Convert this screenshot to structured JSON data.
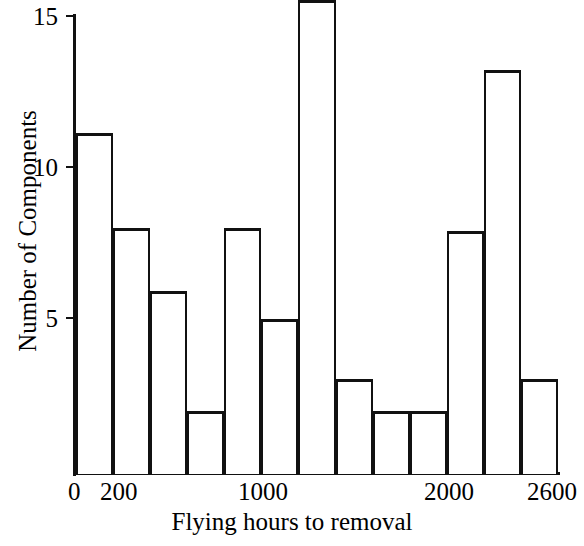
{
  "chart_data": {
    "type": "bar",
    "title": "",
    "xlabel": "Flying hours to removal",
    "ylabel": "Number of Components",
    "ylim": [
      0,
      15
    ],
    "xlim": [
      0,
      2600
    ],
    "grid": false,
    "legend": "none",
    "bin_width": 200,
    "y_ticks": [
      {
        "value": 15,
        "label": "15"
      },
      {
        "value": 10,
        "label": "10"
      },
      {
        "value": 5,
        "label": "5"
      }
    ],
    "x_ticks": [
      {
        "value": 0,
        "label": "0"
      },
      {
        "value": 200,
        "label": "200"
      },
      {
        "value": 1000,
        "label": "1000"
      },
      {
        "value": 2000,
        "label": "2000"
      },
      {
        "value": 2600,
        "label": "2600"
      }
    ],
    "categories": [
      "0-200",
      "200-400",
      "400-600",
      "600-800",
      "800-1000",
      "1000-1200",
      "1200-1400",
      "1400-1600",
      "1600-1800",
      "1800-2000",
      "2000-2200",
      "2200-2400",
      "2400-2600"
    ],
    "bin_edges": [
      0,
      200,
      400,
      600,
      800,
      1000,
      1200,
      1400,
      1600,
      1800,
      2000,
      2200,
      2400,
      2600
    ],
    "values": [
      10.8,
      7.8,
      5.8,
      2.0,
      7.8,
      4.9,
      15.0,
      3.0,
      2.0,
      2.0,
      7.7,
      12.8,
      3.0
    ],
    "series": [
      {
        "name": "Number of Components",
        "values": [
          10.8,
          7.8,
          5.8,
          2.0,
          7.8,
          4.9,
          15.0,
          3.0,
          2.0,
          2.0,
          7.7,
          12.8,
          3.0
        ]
      }
    ],
    "style": {
      "bar_fill": "#ffffff",
      "bar_edge": "#111111",
      "axis_color": "#111111",
      "text_color": "#000000"
    }
  }
}
